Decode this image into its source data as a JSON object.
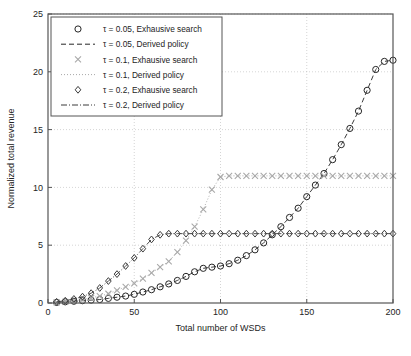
{
  "figure": {
    "caption_fragment": ""
  },
  "chart_data": {
    "type": "line",
    "title": "",
    "xlabel": "Total number of WSDs",
    "ylabel": "Normalized total revenue",
    "xlim": [
      0,
      200
    ],
    "ylim": [
      0,
      25
    ],
    "xticks": [
      0,
      50,
      100,
      150,
      200
    ],
    "yticks": [
      0,
      5,
      10,
      15,
      20,
      25
    ],
    "xtick_labels": [
      "0",
      "50",
      "100",
      "150",
      "200"
    ],
    "ytick_labels": [
      "0",
      "5",
      "10",
      "15",
      "20",
      "25"
    ],
    "grid": true,
    "legend_position": "upper-left",
    "legend_entries": [
      {
        "marker": "circle",
        "line": "none",
        "label": "τ = 0.05, Exhausive search"
      },
      {
        "marker": "none",
        "line": "dashed",
        "label": "τ = 0.05, Derived policy"
      },
      {
        "marker": "cross",
        "line": "none",
        "label": "τ = 0.1, Exhausive search"
      },
      {
        "marker": "none",
        "line": "dotted",
        "label": "τ = 0.1, Derived policy"
      },
      {
        "marker": "diamond",
        "line": "none",
        "label": "τ = 0.2, Exhausive search"
      },
      {
        "marker": "none",
        "line": "dashdot",
        "label": "τ = 0.2, Derived policy"
      }
    ],
    "series": [
      {
        "name": "τ = 0.05, Exhausive search",
        "marker": "circle",
        "line": "dashed",
        "color": "#262626",
        "x": [
          5,
          10,
          15,
          20,
          25,
          30,
          35,
          40,
          45,
          50,
          55,
          60,
          65,
          70,
          75,
          80,
          85,
          90,
          95,
          100,
          105,
          110,
          115,
          120,
          125,
          130,
          135,
          140,
          145,
          150,
          155,
          160,
          165,
          170,
          175,
          180,
          185,
          190,
          195,
          200
        ],
        "y": [
          0.05,
          0.1,
          0.15,
          0.2,
          0.25,
          0.3,
          0.4,
          0.5,
          0.6,
          0.75,
          0.95,
          1.15,
          1.4,
          1.65,
          1.95,
          2.3,
          2.7,
          3.0,
          3.1,
          3.2,
          3.4,
          3.7,
          4.1,
          4.6,
          5.2,
          5.9,
          6.6,
          7.4,
          8.2,
          9.2,
          10.2,
          11.2,
          12.4,
          13.7,
          15.1,
          16.6,
          18.4,
          20.2,
          20.9,
          21.0
        ]
      },
      {
        "name": "τ = 0.1, Exhausive search",
        "marker": "cross",
        "line": "dotted",
        "color": "#a8a8a8",
        "x": [
          5,
          10,
          15,
          20,
          25,
          30,
          35,
          40,
          45,
          50,
          55,
          60,
          65,
          70,
          75,
          80,
          85,
          90,
          95,
          100,
          105,
          110,
          115,
          120,
          125,
          130,
          135,
          140,
          145,
          150,
          155,
          160,
          165,
          170,
          175,
          180,
          185,
          190,
          195,
          200
        ],
        "y": [
          0.05,
          0.1,
          0.2,
          0.3,
          0.45,
          0.6,
          0.8,
          1.1,
          1.4,
          1.7,
          2.1,
          2.6,
          3.1,
          3.6,
          4.4,
          5.4,
          6.6,
          8.1,
          9.8,
          10.9,
          11.0,
          11.0,
          11.0,
          11.0,
          11.0,
          11.0,
          11.0,
          11.0,
          11.0,
          11.0,
          11.0,
          11.0,
          11.0,
          11.0,
          11.0,
          11.0,
          11.0,
          11.0,
          11.0,
          11.0
        ]
      },
      {
        "name": "τ = 0.2, Exhausive search",
        "marker": "diamond",
        "line": "dashdot",
        "color": "#3b3b3b",
        "x": [
          5,
          10,
          15,
          20,
          25,
          30,
          35,
          40,
          45,
          50,
          55,
          60,
          65,
          70,
          75,
          80,
          85,
          90,
          95,
          100,
          105,
          110,
          115,
          120,
          125,
          130,
          135,
          140,
          145,
          150,
          155,
          160,
          165,
          170,
          175,
          180,
          185,
          190,
          195,
          200
        ],
        "y": [
          0.1,
          0.2,
          0.35,
          0.55,
          0.85,
          1.3,
          1.9,
          2.5,
          3.2,
          3.9,
          4.7,
          5.5,
          5.9,
          6.0,
          6.0,
          6.0,
          6.0,
          6.0,
          6.0,
          6.0,
          6.0,
          6.0,
          6.0,
          6.0,
          6.0,
          6.0,
          6.0,
          6.0,
          6.0,
          6.0,
          6.0,
          6.0,
          6.0,
          6.0,
          6.0,
          6.0,
          6.0,
          6.0,
          6.0,
          6.0
        ]
      }
    ]
  }
}
